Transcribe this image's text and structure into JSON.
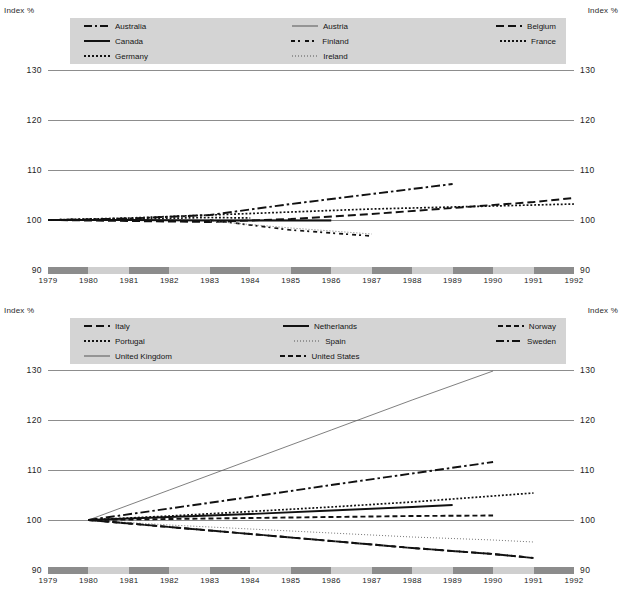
{
  "axis_label_left": "Index %",
  "axis_label_right": "Index %",
  "charts": [
    {
      "id": "top",
      "legend": [
        {
          "label": "Australia",
          "style": "dashdot"
        },
        {
          "label": "Austria",
          "style": "solid-thin"
        },
        {
          "label": "Belgium",
          "style": "longdash"
        },
        {
          "label": "Canada",
          "style": "solid-bold"
        },
        {
          "label": "Finland",
          "style": "dashdotdash"
        },
        {
          "label": "France",
          "style": "dot"
        },
        {
          "label": "Germany",
          "style": "dot"
        },
        {
          "label": "Ireland",
          "style": "finedot"
        },
        {
          "label": "",
          "style": ""
        }
      ]
    },
    {
      "id": "bottom",
      "legend": [
        {
          "label": "Italy",
          "style": "longdash"
        },
        {
          "label": "Netherlands",
          "style": "solid-bold"
        },
        {
          "label": "Norway",
          "style": "dash"
        },
        {
          "label": "Portugal",
          "style": "dot"
        },
        {
          "label": "Spain",
          "style": "finedot"
        },
        {
          "label": "Sweden",
          "style": "dashdot"
        },
        {
          "label": "United Kingdom",
          "style": "solid-thin"
        },
        {
          "label": "United States",
          "style": "dash"
        },
        {
          "label": "",
          "style": ""
        }
      ]
    }
  ],
  "chart_data": [
    {
      "type": "line",
      "title": "",
      "xlabel": "",
      "ylabel": "Index %",
      "ylim": [
        90,
        130
      ],
      "yticks": [
        90,
        100,
        110,
        120,
        130
      ],
      "x": [
        1979,
        1980,
        1981,
        1982,
        1983,
        1984,
        1985,
        1986,
        1987,
        1988,
        1989,
        1990,
        1991,
        1992
      ],
      "xlim": [
        1979,
        1992
      ],
      "grid": true,
      "legend_position": "top-inside",
      "series": [
        {
          "name": "Australia",
          "style": "dashdot",
          "x": [
            1979,
            1981,
            1983,
            1985,
            1987,
            1989
          ],
          "values": [
            100.0,
            100.3,
            101.0,
            103.2,
            105.2,
            107.2
          ]
        },
        {
          "name": "Austria",
          "style": "solid-thin",
          "x": [
            1979,
            1981,
            1983,
            1985,
            1986
          ],
          "values": [
            100.0,
            100.0,
            100.0,
            100.0,
            100.0
          ]
        },
        {
          "name": "Belgium",
          "style": "longdash",
          "x": [
            1979,
            1981,
            1983,
            1985,
            1987,
            1989,
            1991,
            1992
          ],
          "values": [
            100.0,
            99.8,
            99.6,
            100.2,
            101.2,
            102.4,
            103.6,
            104.4
          ]
        },
        {
          "name": "Canada",
          "style": "solid-bold",
          "x": [
            1979,
            1981,
            1983,
            1985,
            1986
          ],
          "values": [
            100.0,
            100.0,
            99.9,
            99.9,
            99.9
          ]
        },
        {
          "name": "Finland",
          "style": "dashdotdash",
          "x": [
            1983,
            1985,
            1987
          ],
          "values": [
            100.0,
            98.0,
            96.8
          ]
        },
        {
          "name": "France",
          "style": "dot",
          "x": [
            1979,
            1981,
            1983,
            1985,
            1987,
            1989,
            1991,
            1992
          ],
          "values": [
            100.0,
            100.4,
            101.0,
            101.6,
            102.2,
            102.6,
            103.0,
            103.2
          ]
        },
        {
          "name": "Germany",
          "style": "dot",
          "x": [
            1979,
            1981,
            1983,
            1984
          ],
          "values": [
            100.0,
            100.2,
            100.5,
            100.4
          ]
        },
        {
          "name": "Ireland",
          "style": "finedot",
          "x": [
            1983,
            1985,
            1987
          ],
          "values": [
            99.8,
            98.4,
            97.2
          ]
        }
      ]
    },
    {
      "type": "line",
      "title": "",
      "xlabel": "",
      "ylabel": "Index %",
      "ylim": [
        90,
        130
      ],
      "yticks": [
        90,
        100,
        110,
        120,
        130
      ],
      "x": [
        1979,
        1980,
        1981,
        1982,
        1983,
        1984,
        1985,
        1986,
        1987,
        1988,
        1989,
        1990,
        1991,
        1992
      ],
      "xlim": [
        1979,
        1992
      ],
      "grid": true,
      "legend_position": "top-inside",
      "series": [
        {
          "name": "United Kingdom",
          "style": "solid-thin",
          "x": [
            1980,
            1982,
            1984,
            1986,
            1988,
            1990
          ],
          "values": [
            100.0,
            106.0,
            112.0,
            118.0,
            124.0,
            129.8
          ]
        },
        {
          "name": "Sweden",
          "style": "dashdot",
          "x": [
            1980,
            1982,
            1984,
            1986,
            1988,
            1990
          ],
          "values": [
            100.0,
            102.3,
            104.6,
            107.0,
            109.3,
            111.6
          ]
        },
        {
          "name": "Portugal",
          "style": "dot",
          "x": [
            1980,
            1982,
            1984,
            1986,
            1988,
            1990,
            1991
          ],
          "values": [
            100.0,
            100.8,
            101.7,
            102.6,
            103.6,
            104.8,
            105.4
          ]
        },
        {
          "name": "Netherlands",
          "style": "solid-bold",
          "x": [
            1980,
            1982,
            1984,
            1986,
            1988,
            1989
          ],
          "values": [
            100.0,
            100.6,
            101.2,
            101.9,
            102.6,
            103.0
          ]
        },
        {
          "name": "United States",
          "style": "dash",
          "x": [
            1980,
            1982,
            1984,
            1986,
            1988,
            1990
          ],
          "values": [
            100.0,
            100.2,
            100.4,
            100.6,
            100.8,
            100.9
          ]
        },
        {
          "name": "Spain",
          "style": "finedot",
          "x": [
            1980,
            1982,
            1984,
            1986,
            1988,
            1990,
            1991
          ],
          "values": [
            100.0,
            99.0,
            98.2,
            97.4,
            96.6,
            96.0,
            95.6
          ]
        },
        {
          "name": "Norway",
          "style": "dash",
          "x": [
            1980,
            1982,
            1984,
            1986,
            1988,
            1990,
            1991
          ],
          "values": [
            100.0,
            98.6,
            97.2,
            95.8,
            94.4,
            93.2,
            92.4
          ]
        },
        {
          "name": "Italy",
          "style": "longdash",
          "x": [
            1980,
            1982,
            1984,
            1986,
            1988,
            1990,
            1991
          ],
          "values": [
            100.0,
            98.6,
            97.2,
            95.8,
            94.4,
            93.2,
            92.4
          ]
        }
      ]
    }
  ],
  "x_axis_band": {
    "labels": [
      "1979",
      "1980",
      "1981",
      "1982",
      "1983",
      "1984",
      "1985",
      "1986",
      "1987",
      "1988",
      "1989",
      "1990",
      "1991",
      "1992"
    ],
    "dark_color": "#8c8c8c",
    "light_color": "#cfcfcf"
  }
}
